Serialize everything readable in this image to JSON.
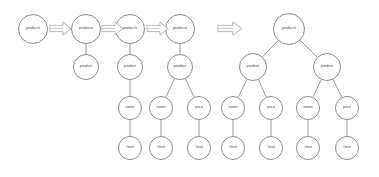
{
  "diagram": {
    "node_labels": {
      "products": "products",
      "product": "product",
      "name": "name",
      "price": "price",
      "text": "#text"
    },
    "colors": {
      "stroke": "#8a8a8a",
      "edge": "#6e6e6e",
      "text": "#3b3b3b",
      "background": "#ffffff",
      "arrow_stroke": "#9a9a9a"
    },
    "stages": [
      {
        "id": "stage-1",
        "nodes": [
          {
            "id": "s1-products",
            "label": "products",
            "cx": 33,
            "cy": 29,
            "r": 15
          }
        ],
        "edges": []
      },
      {
        "id": "stage-2",
        "nodes": [
          {
            "id": "s2-products",
            "label": "products",
            "cx": 86,
            "cy": 29,
            "r": 15
          },
          {
            "id": "s2-product",
            "label": "product",
            "cx": 86,
            "cy": 67,
            "r": 13
          }
        ],
        "edges": [
          {
            "from": "s2-products",
            "to": "s2-product"
          }
        ]
      },
      {
        "id": "stage-3",
        "nodes": [
          {
            "id": "s3-products",
            "label": "products",
            "cx": 130,
            "cy": 29,
            "r": 15
          },
          {
            "id": "s3-product",
            "label": "product",
            "cx": 130,
            "cy": 67,
            "r": 13
          },
          {
            "id": "s3-name",
            "label": "name",
            "cx": 130,
            "cy": 108,
            "r": 12
          },
          {
            "id": "s3-text",
            "label": "#text",
            "cx": 130,
            "cy": 148,
            "r": 12
          }
        ],
        "edges": [
          {
            "from": "s3-products",
            "to": "s3-product"
          },
          {
            "from": "s3-product",
            "to": "s3-name"
          },
          {
            "from": "s3-name",
            "to": "s3-text"
          }
        ]
      },
      {
        "id": "stage-4",
        "nodes": [
          {
            "id": "s4-products",
            "label": "products",
            "cx": 180,
            "cy": 29,
            "r": 15
          },
          {
            "id": "s4-product",
            "label": "product",
            "cx": 180,
            "cy": 67,
            "r": 13
          },
          {
            "id": "s4-name",
            "label": "name",
            "cx": 161,
            "cy": 108,
            "r": 12
          },
          {
            "id": "s4-price",
            "label": "price",
            "cx": 199,
            "cy": 108,
            "r": 12
          },
          {
            "id": "s4-name-text",
            "label": "#text",
            "cx": 161,
            "cy": 148,
            "r": 12
          },
          {
            "id": "s4-price-text",
            "label": "#text",
            "cx": 199,
            "cy": 148,
            "r": 12
          }
        ],
        "edges": [
          {
            "from": "s4-products",
            "to": "s4-product"
          },
          {
            "from": "s4-product",
            "to": "s4-name"
          },
          {
            "from": "s4-product",
            "to": "s4-price"
          },
          {
            "from": "s4-name",
            "to": "s4-name-text"
          },
          {
            "from": "s4-price",
            "to": "s4-price-text"
          }
        ]
      },
      {
        "id": "stage-final",
        "nodes": [
          {
            "id": "f-products",
            "label": "products",
            "cx": 289,
            "cy": 29,
            "r": 16
          },
          {
            "id": "f-product-left",
            "label": "product",
            "cx": 253,
            "cy": 67,
            "r": 14
          },
          {
            "id": "f-product-right",
            "label": "product",
            "cx": 327,
            "cy": 67,
            "r": 14
          },
          {
            "id": "f-name-1",
            "label": "name",
            "cx": 233,
            "cy": 108,
            "r": 12
          },
          {
            "id": "f-price-1",
            "label": "price",
            "cx": 271,
            "cy": 108,
            "r": 12
          },
          {
            "id": "f-name-2",
            "label": "name",
            "cx": 308,
            "cy": 108,
            "r": 12
          },
          {
            "id": "f-price-2",
            "label": "price",
            "cx": 347,
            "cy": 108,
            "r": 12
          },
          {
            "id": "f-text-1",
            "label": "#text",
            "cx": 233,
            "cy": 148,
            "r": 12
          },
          {
            "id": "f-text-2",
            "label": "#text",
            "cx": 271,
            "cy": 148,
            "r": 12
          },
          {
            "id": "f-text-3",
            "label": "#text",
            "cx": 308,
            "cy": 148,
            "r": 12
          },
          {
            "id": "f-text-4",
            "label": "#text",
            "cx": 347,
            "cy": 148,
            "r": 12
          }
        ],
        "edges": [
          {
            "from": "f-products",
            "to": "f-product-left"
          },
          {
            "from": "f-products",
            "to": "f-product-right"
          },
          {
            "from": "f-product-left",
            "to": "f-name-1"
          },
          {
            "from": "f-product-left",
            "to": "f-price-1"
          },
          {
            "from": "f-product-right",
            "to": "f-name-2"
          },
          {
            "from": "f-product-right",
            "to": "f-price-2"
          },
          {
            "from": "f-name-1",
            "to": "f-text-1"
          },
          {
            "from": "f-price-1",
            "to": "f-text-2"
          },
          {
            "from": "f-name-2",
            "to": "f-text-3"
          },
          {
            "from": "f-price-2",
            "to": "f-text-4"
          }
        ]
      }
    ],
    "arrows": [
      {
        "id": "arrow-1",
        "name": "transition-arrow-1",
        "x": 50,
        "y": 22,
        "w": 21,
        "h": 13
      },
      {
        "id": "arrow-2",
        "name": "transition-arrow-2",
        "x": 102,
        "y": 22,
        "w": 21,
        "h": 13
      },
      {
        "id": "arrow-3",
        "name": "transition-arrow-3",
        "x": 147,
        "y": 22,
        "w": 21,
        "h": 13
      },
      {
        "id": "arrow-4",
        "name": "transition-arrow-final",
        "x": 218,
        "y": 22,
        "w": 24,
        "h": 13
      }
    ]
  }
}
